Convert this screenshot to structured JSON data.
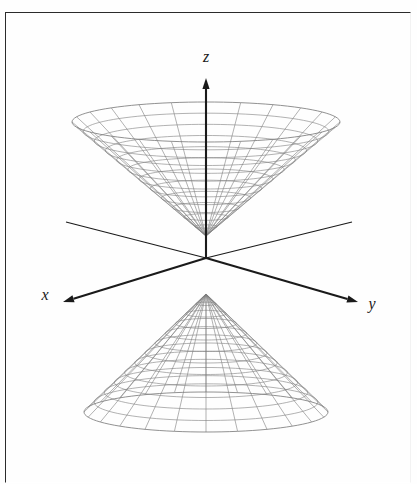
{
  "figure": {
    "background_color": "#fefefe",
    "frame_color": "#2b2b2b",
    "wire_color": "#7a7a7a",
    "axis_color": "#1a1a1a",
    "axes": [
      {
        "id": "z",
        "label": "z",
        "direction": "up",
        "label_x": 206,
        "label_y": 62
      },
      {
        "id": "x",
        "label": "x",
        "direction": "lower-left",
        "label_x": 45,
        "label_y": 300
      },
      {
        "id": "y",
        "label": "y",
        "direction": "lower-right",
        "label_x": 372,
        "label_y": 309
      }
    ],
    "chart_data": {
      "type": "line",
      "plot_kind": "3d-wireframe-surface",
      "surface": "elliptic cone  z^2 = x^2 + y^2  (two nappes)",
      "title": "Elliptic cone (double cone)",
      "xlabel": "x",
      "ylabel": "y",
      "zlabel": "z",
      "grid": false,
      "legend": "none",
      "projection": {
        "origin_px": [
          206,
          258
        ],
        "z_axis_tip_px": [
          206,
          78
        ],
        "x_axis_tip_px": [
          63,
          302
        ],
        "y_axis_tip_px": [
          358,
          302
        ],
        "x_axis_back_tip_px": [
          352,
          222
        ],
        "y_axis_back_tip_px": [
          66,
          222
        ]
      },
      "nappes": [
        {
          "name": "upper-nappe",
          "apex_px": [
            206,
            236
          ],
          "rim_center_px": [
            206,
            122
          ],
          "rim_radius_x_px": 134,
          "rim_radius_y_px": 20,
          "opens": "upward",
          "meridians": 24,
          "rings": 12
        },
        {
          "name": "lower-nappe",
          "apex_px": [
            206,
            294
          ],
          "rim_center_px": [
            206,
            412
          ],
          "rim_radius_x_px": 122,
          "rim_radius_y_px": 20,
          "opens": "downward",
          "meridians": 24,
          "rings": 12
        }
      ]
    }
  }
}
